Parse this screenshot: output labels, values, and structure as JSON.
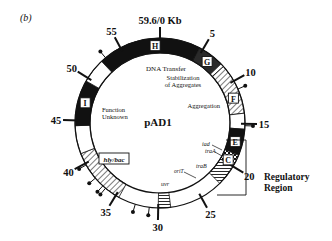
{
  "panel_label": "(b)",
  "plasmid": {
    "name": "pAD1",
    "size_kb": 59.6,
    "origin_label": "59.6/0 Kb"
  },
  "ticks": [
    {
      "kb": 5,
      "label": "5"
    },
    {
      "kb": 10,
      "label": "10"
    },
    {
      "kb": 15,
      "label": "15"
    },
    {
      "kb": 20,
      "label": "20"
    },
    {
      "kb": 25,
      "label": "25"
    },
    {
      "kb": 30,
      "label": "30"
    },
    {
      "kb": 35,
      "label": "35"
    },
    {
      "kb": 40,
      "label": "40"
    },
    {
      "kb": 45,
      "label": "45"
    },
    {
      "kb": 50,
      "label": "50"
    },
    {
      "kb": 55,
      "label": "55"
    }
  ],
  "segments": [
    {
      "start": 52.4,
      "end": 59.6,
      "fill": "black"
    },
    {
      "start": 0,
      "end": 4.6,
      "fill": "black"
    },
    {
      "start": 4.6,
      "end": 7.6,
      "fill": "dark"
    },
    {
      "start": 7.6,
      "end": 8.0,
      "fill": "white"
    },
    {
      "start": 8.0,
      "end": 13.8,
      "fill": "hatch"
    },
    {
      "start": 13.8,
      "end": 15.6,
      "fill": "white"
    },
    {
      "start": 15.6,
      "end": 18.6,
      "fill": "black"
    },
    {
      "start": 18.6,
      "end": 20.0,
      "fill": "checker"
    },
    {
      "start": 20.0,
      "end": 22.4,
      "fill": "hstripe"
    },
    {
      "start": 28.6,
      "end": 30.0,
      "fill": "hstripe"
    },
    {
      "start": 34.6,
      "end": 41.2,
      "fill": "hatch"
    },
    {
      "start": 41.2,
      "end": 44.4,
      "fill": "white"
    },
    {
      "start": 44.4,
      "end": 49.6,
      "fill": "black"
    },
    {
      "start": 49.6,
      "end": 52.4,
      "fill": "white"
    }
  ],
  "region_boxes": [
    {
      "letter": "H",
      "kb": 59.0
    },
    {
      "letter": "G",
      "kb": 6.2
    },
    {
      "letter": "F",
      "kb": 11.8
    },
    {
      "letter": "E",
      "kb": 17.2
    },
    {
      "letter": "C",
      "kb": 19.6
    },
    {
      "letter": "I",
      "kb": 47.2
    }
  ],
  "function_labels": [
    {
      "text": "DNA Transfer",
      "id": "dna-transfer"
    },
    {
      "text": "Stabilization",
      "id": "stabilization-1"
    },
    {
      "text": "of Aggregates",
      "id": "stabilization-2"
    },
    {
      "text": "Aggregation",
      "id": "aggregation"
    },
    {
      "text": "Function",
      "id": "function-unknown-1"
    },
    {
      "text": "Unknown",
      "id": "function-unknown-2"
    }
  ],
  "gene_labels": [
    {
      "text": "iad",
      "id": "iad"
    },
    {
      "text": "traA",
      "id": "traA"
    },
    {
      "text": "oriT",
      "id": "oriT"
    },
    {
      "text": "traB",
      "id": "traB"
    },
    {
      "text": "uvr",
      "id": "uvr"
    },
    {
      "text": "hly/bac",
      "id": "hly-bac"
    }
  ],
  "regulatory_region": {
    "line1": "Regulatory",
    "line2": "Region"
  },
  "transposon_pins_kb": [
    53.0,
    11.0,
    15.2,
    39.8,
    38.0,
    36.8,
    36.4,
    32.6,
    31.0
  ]
}
